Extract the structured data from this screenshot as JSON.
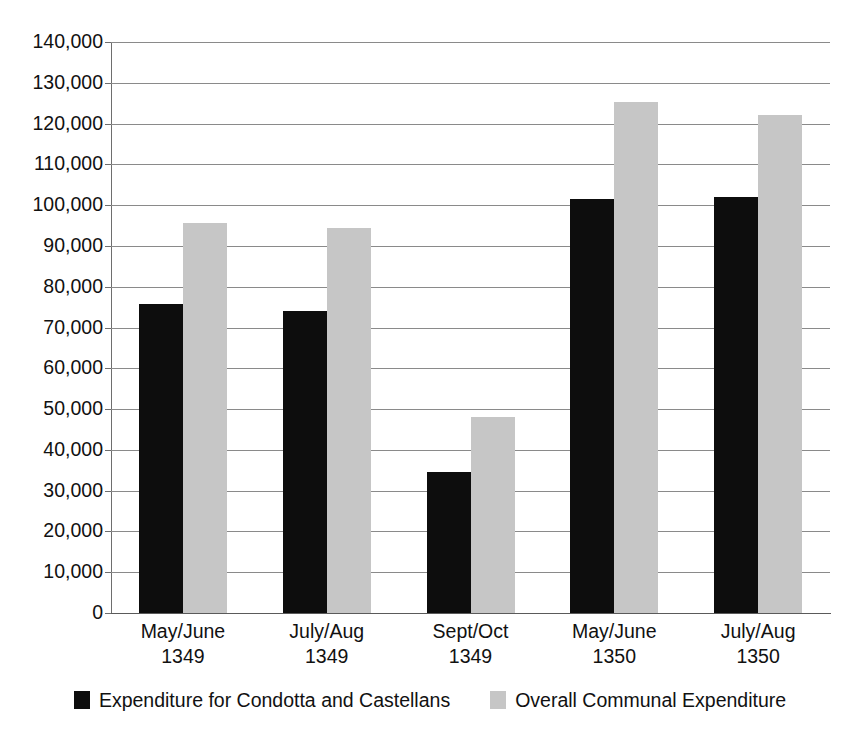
{
  "figure": {
    "title_partial": "",
    "background": "#ffffff"
  },
  "legend": {
    "position": "bottom-center",
    "items": [
      {
        "label": "Expenditure for Condotta and Castellans",
        "color": "#0d0d0d",
        "swatch": "black-square-swatch"
      },
      {
        "label": "Overall Communal Expenditure",
        "color": "#c6c6c6",
        "swatch": "gray-square-swatch"
      }
    ]
  },
  "axes": {
    "y_ticks": [
      "140,000",
      "130,000",
      "120,000",
      "110,000",
      "100,000",
      "90,000",
      "80,000",
      "70,000",
      "60,000",
      "50,000",
      "40,000",
      "30,000",
      "20,000",
      "10,000",
      "0"
    ],
    "x_ticks": [
      {
        "period": "May/June",
        "year": "1349"
      },
      {
        "period": "July/Aug",
        "year": "1349"
      },
      {
        "period": "Sept/Oct",
        "year": "1349"
      },
      {
        "period": "May/June",
        "year": "1350"
      },
      {
        "period": "July/Aug",
        "year": "1350"
      }
    ]
  },
  "chart_data": {
    "type": "bar",
    "title": "",
    "subtitle": "",
    "xlabel": "",
    "ylabel": "",
    "ylim": [
      0,
      140000
    ],
    "ytick_interval": 10000,
    "grid": true,
    "grid_axis": "y",
    "legend_position": "bottom-center",
    "categories": [
      "May/June 1349",
      "July/Aug 1349",
      "Sept/Oct 1349",
      "May/June 1350",
      "July/Aug 1350"
    ],
    "series": [
      {
        "name": "Expenditure for Condotta and Castellans",
        "color": "#0d0d0d",
        "values": [
          75800,
          74000,
          34500,
          101500,
          102000
        ]
      },
      {
        "name": "Overall Communal Expenditure",
        "color": "#c6c6c6",
        "values": [
          95500,
          94400,
          48000,
          125300,
          122000
        ]
      }
    ]
  }
}
